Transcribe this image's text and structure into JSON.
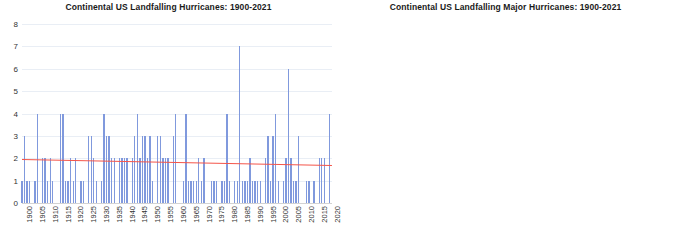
{
  "figure": {
    "background": "#ffffff",
    "bar_color": "#8099dd",
    "trend_color": "#f4554a",
    "grid_color": "#e9eef5"
  },
  "chart_data": [
    {
      "type": "bar",
      "title": "Continental US Landfalling Hurricanes: 1900-2021",
      "xlabel": "",
      "ylabel": "",
      "ylim": [
        0,
        8
      ],
      "yticks": [
        0,
        1,
        2,
        3,
        4,
        5,
        6,
        7,
        8
      ],
      "xlim": [
        1900,
        2021
      ],
      "xticks": [
        1900,
        1905,
        1910,
        1915,
        1920,
        1925,
        1930,
        1935,
        1940,
        1945,
        1950,
        1955,
        1960,
        1965,
        1970,
        1975,
        1980,
        1985,
        1990,
        1995,
        2000,
        2005,
        2010,
        2015,
        2020
      ],
      "grid": true,
      "legend": "none",
      "x": [
        1900,
        1901,
        1902,
        1903,
        1904,
        1905,
        1906,
        1907,
        1908,
        1909,
        1910,
        1911,
        1912,
        1913,
        1914,
        1915,
        1916,
        1917,
        1918,
        1919,
        1920,
        1921,
        1922,
        1923,
        1924,
        1925,
        1926,
        1927,
        1928,
        1929,
        1930,
        1931,
        1932,
        1933,
        1934,
        1935,
        1936,
        1937,
        1938,
        1939,
        1940,
        1941,
        1942,
        1943,
        1944,
        1945,
        1946,
        1947,
        1948,
        1949,
        1950,
        1951,
        1952,
        1953,
        1954,
        1955,
        1956,
        1957,
        1958,
        1959,
        1960,
        1961,
        1962,
        1963,
        1964,
        1965,
        1966,
        1967,
        1968,
        1969,
        1970,
        1971,
        1972,
        1973,
        1974,
        1975,
        1976,
        1977,
        1978,
        1979,
        1980,
        1981,
        1982,
        1983,
        1984,
        1985,
        1986,
        1987,
        1988,
        1989,
        1990,
        1991,
        1992,
        1993,
        1994,
        1995,
        1996,
        1997,
        1998,
        1999,
        2000,
        2001,
        2002,
        2003,
        2004,
        2005,
        2006,
        2007,
        2008,
        2009,
        2010,
        2011,
        2012,
        2013,
        2014,
        2015,
        2016,
        2017,
        2018,
        2019,
        2020,
        2021
      ],
      "values": [
        1,
        3,
        1,
        1,
        0,
        1,
        4,
        0,
        2,
        2,
        1,
        2,
        1,
        0,
        0,
        4,
        4,
        1,
        1,
        2,
        1,
        2,
        0,
        1,
        1,
        0,
        3,
        3,
        2,
        1,
        0,
        1,
        4,
        3,
        3,
        2,
        2,
        0,
        2,
        2,
        2,
        2,
        0,
        2,
        3,
        4,
        2,
        3,
        3,
        2,
        3,
        1,
        0,
        3,
        3,
        2,
        2,
        2,
        0,
        3,
        4,
        0,
        0,
        1,
        4,
        1,
        1,
        1,
        1,
        2,
        1,
        2,
        0,
        0,
        1,
        1,
        1,
        0,
        1,
        1,
        4,
        1,
        0,
        1,
        1,
        7,
        1,
        1,
        1,
        2,
        1,
        1,
        1,
        1,
        0,
        2,
        3,
        1,
        3,
        4,
        1,
        0,
        1,
        2,
        6,
        2,
        1,
        1,
        3,
        0,
        0,
        1,
        1,
        0,
        1,
        0,
        2,
        2,
        2,
        0,
        4,
        0
      ],
      "trend": {
        "start_value": 1.97,
        "end_value": 1.7,
        "color": "#f4554a"
      }
    },
    {
      "type": "bar",
      "title": "Continental US Landfalling Major Hurricanes: 1900-2021",
      "xlabel": "",
      "ylabel": "",
      "ylim": [
        0,
        4
      ],
      "yticks": [
        0,
        1,
        2,
        3,
        4
      ],
      "xlim": [
        1900,
        2021
      ],
      "xticks": [
        1900,
        1905,
        1910,
        1915,
        1920,
        1925,
        1930,
        1935,
        1940,
        1945,
        1950,
        1955,
        1960,
        1965,
        1970,
        1975,
        1980,
        1985,
        1990,
        1995,
        2000,
        2005,
        2010,
        2015,
        2020
      ],
      "grid": true,
      "legend": "none",
      "x": [
        1900,
        1901,
        1902,
        1903,
        1904,
        1905,
        1906,
        1907,
        1908,
        1909,
        1910,
        1911,
        1912,
        1913,
        1914,
        1915,
        1916,
        1917,
        1918,
        1919,
        1920,
        1921,
        1922,
        1923,
        1924,
        1925,
        1926,
        1927,
        1928,
        1929,
        1930,
        1931,
        1932,
        1933,
        1934,
        1935,
        1936,
        1937,
        1938,
        1939,
        1940,
        1941,
        1942,
        1943,
        1944,
        1945,
        1946,
        1947,
        1948,
        1949,
        1950,
        1951,
        1952,
        1953,
        1954,
        1955,
        1956,
        1957,
        1958,
        1959,
        1960,
        1961,
        1962,
        1963,
        1964,
        1965,
        1966,
        1967,
        1968,
        1969,
        1970,
        1971,
        1972,
        1973,
        1974,
        1975,
        1976,
        1977,
        1978,
        1979,
        1980,
        1981,
        1982,
        1983,
        1984,
        1985,
        1986,
        1987,
        1988,
        1989,
        1990,
        1991,
        1992,
        1993,
        1994,
        1995,
        1996,
        1997,
        1998,
        1999,
        2000,
        2001,
        2002,
        2003,
        2004,
        2005,
        2006,
        2007,
        2008,
        2009,
        2010,
        2011,
        2012,
        2013,
        2014,
        2015,
        2016,
        2017,
        2018,
        2019,
        2020,
        2021
      ],
      "values": [
        1,
        0,
        0,
        0,
        0,
        1,
        0,
        0,
        0,
        3,
        0,
        0,
        0,
        0,
        0,
        2,
        2,
        1,
        1,
        1,
        0,
        1,
        0,
        0,
        0,
        1,
        1,
        0,
        1,
        0,
        0,
        0,
        1,
        0,
        0,
        1,
        1,
        0,
        1,
        0,
        0,
        1,
        1,
        0,
        1,
        2,
        0,
        1,
        1,
        2,
        2,
        0,
        0,
        0,
        2,
        0,
        1,
        1,
        0,
        0,
        1,
        1,
        0,
        0,
        1,
        2,
        0,
        1,
        0,
        1,
        1,
        0,
        0,
        0,
        0,
        1,
        0,
        0,
        0,
        1,
        0,
        0,
        0,
        1,
        0,
        3,
        0,
        0,
        0,
        1,
        0,
        0,
        1,
        0,
        0,
        2,
        0,
        0,
        1,
        0,
        0,
        0,
        0,
        0,
        3,
        4,
        0,
        0,
        0,
        0,
        0,
        0,
        0,
        0,
        0,
        0,
        0,
        2,
        1,
        0,
        1,
        1
      ],
      "trend": {
        "start_value": 0.64,
        "end_value": 0.55,
        "color": "#f4554a"
      }
    }
  ]
}
